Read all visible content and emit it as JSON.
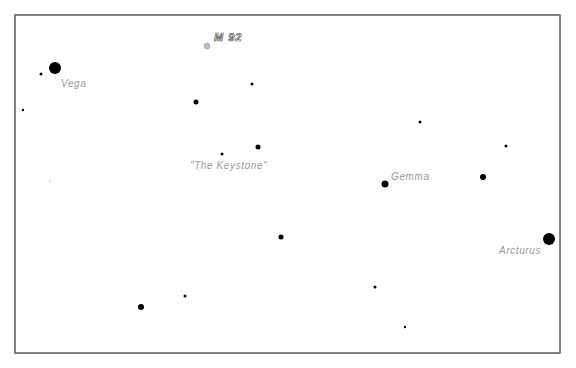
{
  "chart": {
    "title": "",
    "frame": {
      "x": 15,
      "y": 15,
      "width": 545,
      "height": 338,
      "border_color": "#5a5a5a"
    },
    "colors": {
      "star": "#000000",
      "label": "#9a9a9a",
      "cluster": "#bdbdbd",
      "background": "#ffffff"
    }
  },
  "chart_data": {
    "type": "scatter",
    "title": "",
    "xlabel": "",
    "ylabel": "",
    "grid": false,
    "legend": "none",
    "named_objects": [
      {
        "name": "Vega",
        "kind": "star",
        "x": 55,
        "y": 68,
        "r": 6
      },
      {
        "name": "M 92",
        "kind": "globular-cluster",
        "x": 207,
        "y": 46,
        "r": 3
      },
      {
        "name": "\"The Keystone\"",
        "kind": "asterism-label",
        "x": 233,
        "y": 168
      },
      {
        "name": "Gemma",
        "kind": "star",
        "x": 385,
        "y": 184,
        "r": 3.5
      },
      {
        "name": "Arcturus",
        "kind": "star",
        "x": 549,
        "y": 239,
        "r": 6
      }
    ],
    "stars": [
      {
        "x": 55,
        "y": 68,
        "r": 6
      },
      {
        "x": 41,
        "y": 74,
        "r": 1.5
      },
      {
        "x": 23,
        "y": 110,
        "r": 1.2
      },
      {
        "x": 196,
        "y": 102,
        "r": 2.5
      },
      {
        "x": 252,
        "y": 84,
        "r": 1.5
      },
      {
        "x": 222,
        "y": 154,
        "r": 1.5
      },
      {
        "x": 258,
        "y": 147,
        "r": 2.5
      },
      {
        "x": 385,
        "y": 184,
        "r": 3.5
      },
      {
        "x": 420,
        "y": 122,
        "r": 1.5
      },
      {
        "x": 506,
        "y": 146,
        "r": 1.5
      },
      {
        "x": 483,
        "y": 177,
        "r": 3
      },
      {
        "x": 549,
        "y": 239,
        "r": 6
      },
      {
        "x": 281,
        "y": 237,
        "r": 2.5
      },
      {
        "x": 141,
        "y": 307,
        "r": 3
      },
      {
        "x": 185,
        "y": 296,
        "r": 1.5
      },
      {
        "x": 375,
        "y": 287,
        "r": 1.5
      },
      {
        "x": 405,
        "y": 327,
        "r": 1.2
      }
    ],
    "faint_marks": [
      {
        "x": 50,
        "y": 181,
        "r": 1
      }
    ]
  },
  "labels": {
    "vega": "Vega",
    "m92": "M 92",
    "keystone": "\"The Keystone\"",
    "gemma": "Gemma",
    "arcturus": "Arcturus"
  }
}
